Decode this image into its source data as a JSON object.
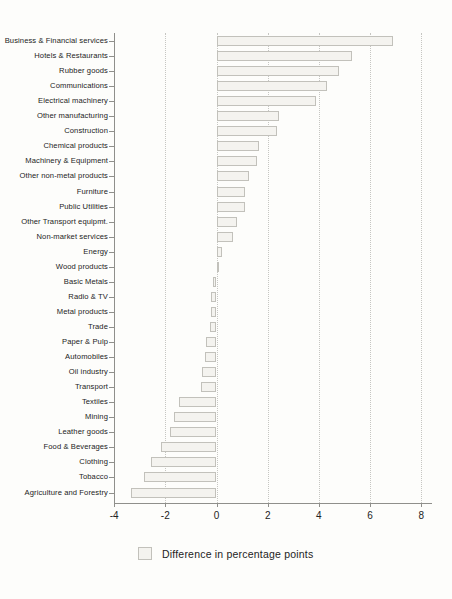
{
  "chart_data": {
    "type": "bar",
    "orientation": "horizontal",
    "title": "",
    "xlabel": "",
    "ylabel": "",
    "legend_label": "Difference in percentage points",
    "legend_position": "bottom-center",
    "grid": "vertical-dotted",
    "xlim": [
      -4,
      8.5
    ],
    "xticks": [
      -4,
      -2,
      0,
      2,
      4,
      6,
      8
    ],
    "bar_fill_color": "#f4f3ef",
    "bar_border_color": "#c2c1bb",
    "categories": [
      "Business & Financial services",
      "Hotels & Restaurants",
      "Rubber goods",
      "Communications",
      "Electrical machinery",
      "Other manufacturing",
      "Construction",
      "Chemical products",
      "Machinery & Equipment",
      "Other non-metal products",
      "Furniture",
      "Public Utilities",
      "Other Transport equipmt.",
      "Non-market services",
      "Energy",
      "Wood products",
      "Basic Metals",
      "Radio & TV",
      "Metal products",
      "Trade",
      "Paper & Pulp",
      "Automobiles",
      "Oil industry",
      "Transport",
      "Textiles",
      "Mining",
      "Leather goods",
      "Food & Beverages",
      "Clothing",
      "Tobacco",
      "Agriculture and Forestry"
    ],
    "values": [
      6.9,
      5.3,
      4.8,
      4.3,
      3.9,
      2.45,
      2.35,
      1.65,
      1.6,
      1.25,
      1.1,
      1.1,
      0.8,
      0.65,
      0.2,
      0.1,
      -0.15,
      -0.2,
      -0.2,
      -0.25,
      -0.4,
      -0.45,
      -0.55,
      -0.6,
      -1.45,
      -1.65,
      -1.8,
      -2.15,
      -2.55,
      -2.85,
      -3.35
    ]
  }
}
